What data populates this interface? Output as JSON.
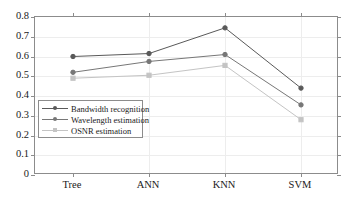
{
  "chart_data": {
    "type": "line",
    "title": "",
    "xlabel": "",
    "ylabel": "",
    "categories": [
      "Tree",
      "ANN",
      "KNN",
      "SVM"
    ],
    "ylim": [
      0,
      0.8
    ],
    "ytick_labels": [
      "0",
      "0.1",
      "0.2",
      "0.3",
      "0.4",
      "0.5",
      "0.6",
      "0.7",
      "0.8"
    ],
    "ytick_values": [
      0,
      0.1,
      0.2,
      0.3,
      0.4,
      0.5,
      0.6,
      0.7,
      0.8
    ],
    "grid": true,
    "legend_position": "lower-left-inside",
    "series": [
      {
        "name": "Bandwidth recognition",
        "color": "#595959",
        "marker": "circle",
        "values": [
          0.6,
          0.615,
          0.745,
          0.44
        ]
      },
      {
        "name": "Wavelength estimation",
        "color": "#777777",
        "marker": "circle",
        "values": [
          0.52,
          0.575,
          0.61,
          0.355
        ]
      },
      {
        "name": "OSNR estimation",
        "color": "#c4c4c4",
        "marker": "square",
        "values": [
          0.49,
          0.505,
          0.555,
          0.28
        ]
      }
    ]
  },
  "legend": {
    "items": [
      {
        "label": "Bandwidth recognition"
      },
      {
        "label": "Wavelength estimation"
      },
      {
        "label": "OSNR estimation"
      }
    ]
  },
  "axes": {
    "x_categories": [
      "Tree",
      "ANN",
      "KNN",
      "SVM"
    ],
    "y_labels": [
      "0.8",
      "0.7",
      "0.6",
      "0.5",
      "0.4",
      "0.3",
      "0.2",
      "0.1",
      "0"
    ]
  },
  "colors": {
    "frame": "#8c8c8c",
    "grid": "#ededed",
    "series1": "#595959",
    "series2": "#777777",
    "series3": "#c4c4c4",
    "text": "#1a1a1a"
  }
}
